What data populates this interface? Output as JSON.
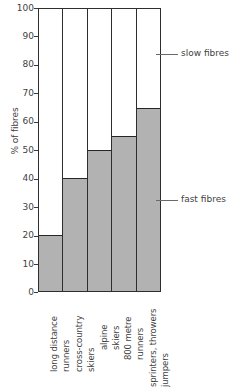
{
  "chart_data": {
    "type": "bar",
    "title": "",
    "xlabel": "",
    "ylabel": "% of fibres",
    "ylim": [
      0,
      100
    ],
    "yticks": [
      0,
      10,
      20,
      30,
      40,
      50,
      60,
      70,
      80,
      90,
      100
    ],
    "ytick_labels": [
      "0",
      "10",
      "20",
      "30",
      "40",
      "50",
      "60",
      "70",
      "80",
      "90",
      "100"
    ],
    "grid": false,
    "legend_position": "right-annotations",
    "stacked": true,
    "categories": [
      "long distance runners",
      "cross-country skiers",
      "alpine skiers",
      "800 metre runners",
      "sprinters, throwers jumpers"
    ],
    "category_lines": [
      [
        "long distance",
        "runners"
      ],
      [
        "cross-country",
        "skiers"
      ],
      [
        "alpine",
        "skiers"
      ],
      [
        "800 metre",
        "runners"
      ],
      [
        "sprinters, throwers",
        "jumpers"
      ]
    ],
    "series": [
      {
        "name": "fast fibres",
        "color": "#b2b2b2",
        "values": [
          20,
          40,
          50,
          55,
          65
        ]
      },
      {
        "name": "slow fibres",
        "color": "#ffffff",
        "values": [
          80,
          60,
          50,
          45,
          35
        ]
      }
    ],
    "annotations": [
      {
        "label": "slow fibres",
        "value": 84
      },
      {
        "label": "fast fibres",
        "value": 32
      }
    ]
  },
  "axis": {
    "y_title": "% of fibres"
  },
  "legend": {
    "slow_label": "slow fibres",
    "fast_label": "fast fibres"
  },
  "ticks": {
    "t0": "100",
    "t1": "90",
    "t2": "80",
    "t3": "70",
    "t4": "60",
    "t5": "50",
    "t6": "40",
    "t7": "30",
    "t8": "20",
    "t9": "10",
    "t10": "0"
  },
  "cats": {
    "c0l0": "long distance",
    "c0l1": "runners",
    "c1l0": "cross-country",
    "c1l1": "skiers",
    "c2l0": "alpine",
    "c2l1": "skiers",
    "c3l0": "800 metre",
    "c3l1": "runners",
    "c4l0": "sprinters, throwers",
    "c4l1": "jumpers"
  }
}
